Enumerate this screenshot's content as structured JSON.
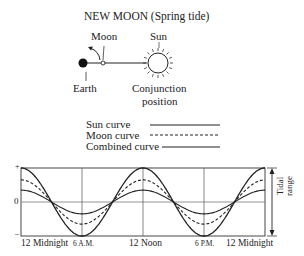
{
  "title": "NEW MOON (Spring tide)",
  "orbit_diagram": {
    "moon_label": "Moon",
    "sun_label": "Sun",
    "earth_label": "Earth",
    "conjunction_label_line1": "Conjunction",
    "conjunction_label_line2": "position"
  },
  "legend": {
    "items": [
      {
        "label": "Sun curve",
        "style": "solid"
      },
      {
        "label": "Moon curve",
        "style": "dashed"
      },
      {
        "label": "Combined curve",
        "style": "solid"
      }
    ]
  },
  "axis": {
    "y_plus": "+",
    "y_zero": "0",
    "y_minus": "–",
    "right_label_line1": "Tidal",
    "right_label_line2": "range",
    "x_ticks": [
      "12 Midnight",
      "6 A.M.",
      "12 Noon",
      "6 P.M.",
      "12 Midnight"
    ]
  },
  "chart_data": {
    "type": "line",
    "title": "NEW MOON (Spring tide)",
    "xlabel": "",
    "ylabel": "Tidal range",
    "x": [
      "12 Midnight",
      "6 A.M.",
      "12 Noon",
      "6 P.M.",
      "12 Midnight"
    ],
    "ylim": [
      -1,
      1
    ],
    "grid": true,
    "series": [
      {
        "name": "Sun curve",
        "amplitude": 0.35,
        "values": [
          0.35,
          -0.35,
          0.35,
          -0.35,
          0.35
        ]
      },
      {
        "name": "Moon curve",
        "amplitude": 0.65,
        "values": [
          0.65,
          -0.65,
          0.65,
          -0.65,
          0.65
        ]
      },
      {
        "name": "Combined curve",
        "amplitude": 1.0,
        "values": [
          1.0,
          -1.0,
          1.0,
          -1.0,
          1.0
        ]
      }
    ],
    "legend_position": "top"
  }
}
